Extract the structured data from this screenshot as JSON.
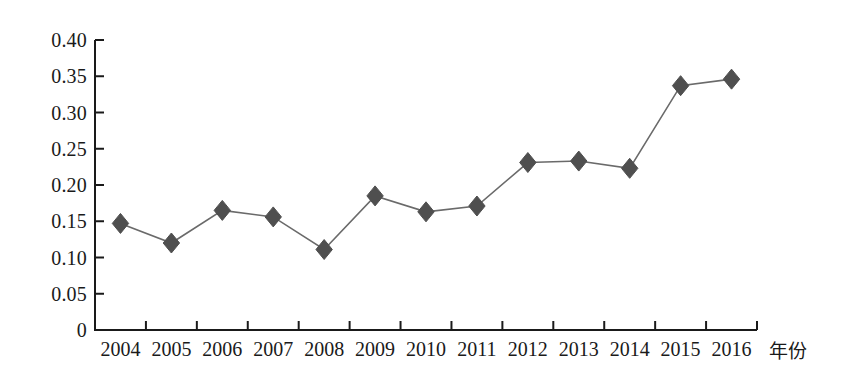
{
  "chart_data": {
    "type": "line",
    "title": "",
    "subtitle": "",
    "xlabel": "年份",
    "ylabel": "",
    "categories": [
      "2004",
      "2005",
      "2006",
      "2007",
      "2008",
      "2009",
      "2010",
      "2011",
      "2012",
      "2013",
      "2014",
      "2015",
      "2016"
    ],
    "values": [
      0.147,
      0.12,
      0.165,
      0.156,
      0.111,
      0.185,
      0.163,
      0.171,
      0.231,
      0.233,
      0.223,
      0.337,
      0.346
    ],
    "series": [
      {
        "name": "",
        "values": [
          0.147,
          0.12,
          0.165,
          0.156,
          0.111,
          0.185,
          0.163,
          0.171,
          0.231,
          0.233,
          0.223,
          0.337,
          0.346
        ]
      }
    ],
    "ylim": [
      0,
      0.4
    ],
    "ytick_labels": [
      "0",
      "0.05",
      "0.10",
      "0.15",
      "0.20",
      "0.25",
      "0.30",
      "0.35",
      "0.40"
    ],
    "ytick_values": [
      0,
      0.05,
      0.1,
      0.15,
      0.2,
      0.25,
      0.3,
      0.35,
      0.4
    ],
    "grid": false,
    "legend": "none",
    "marker": "diamond",
    "marker_color": "#4f4f4f",
    "line_color": "#6a6a6a",
    "axis_color": "#1a1a1a",
    "background_color": "#ffffff"
  }
}
